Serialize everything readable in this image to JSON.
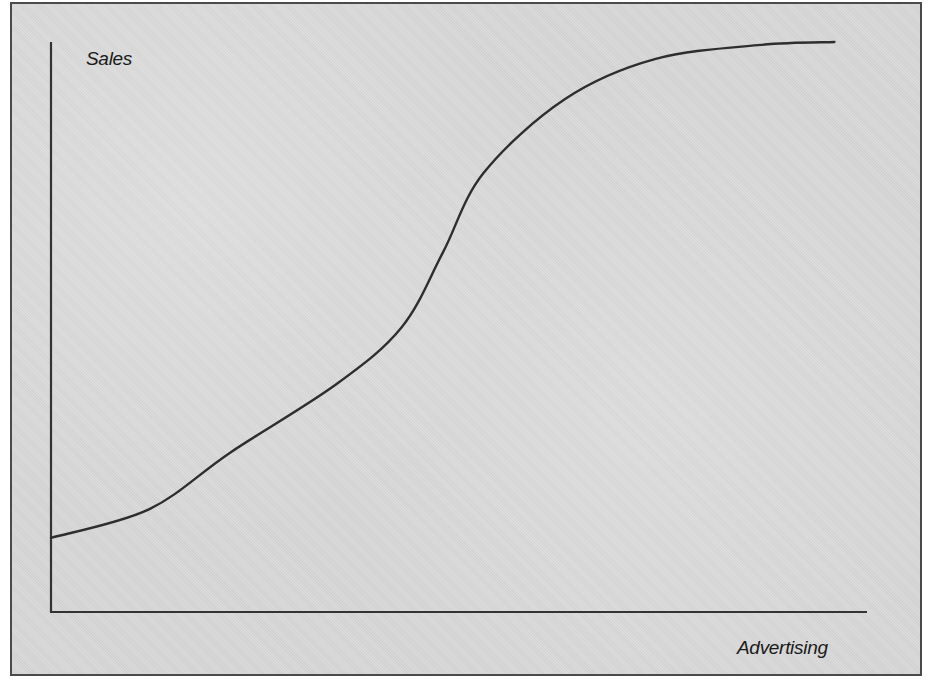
{
  "chart_data": {
    "type": "line",
    "title": "",
    "xlabel": "Advertising",
    "ylabel": "Sales",
    "grid": false,
    "legend": null,
    "ticks": {
      "x": [],
      "y": []
    },
    "xlim": [
      0,
      100
    ],
    "ylim": [
      0,
      100
    ],
    "units": "normalized (no numeric scale shown)",
    "series": [
      {
        "name": "Sales response curve",
        "shape": "S-curve (sigmoid)",
        "x": [
          0,
          12,
          22,
          35,
          43,
          48,
          53,
          63,
          74,
          87,
          96
        ],
        "y": [
          13,
          18,
          28,
          40,
          50,
          63,
          77,
          90,
          97,
          99.5,
          100
        ]
      }
    ]
  },
  "labels": {
    "y_axis": "Sales",
    "x_axis": "Advertising"
  },
  "style": {
    "background": "#d9d9d9",
    "frame_color": "#4a4a4a",
    "axis_color": "#333333",
    "curve_color": "#2e2e2e"
  },
  "plot_px": {
    "x0": 51,
    "x1": 867,
    "y0": 612,
    "y1": 42
  }
}
